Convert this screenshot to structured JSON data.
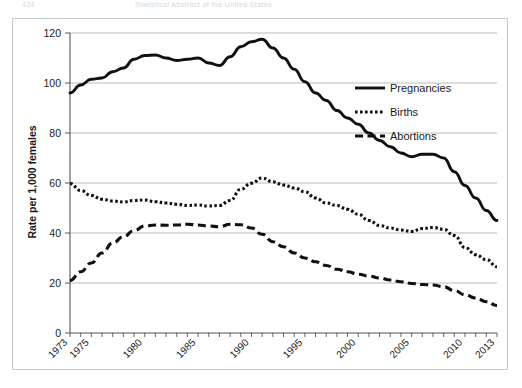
{
  "page": {
    "header_page_number": "424",
    "header_title": "Statistical Abstract of the United States"
  },
  "chart_data": {
    "type": "line",
    "title": "",
    "xlabel": "",
    "ylabel": "Rate per 1,000 females",
    "xlim": [
      1973,
      2013
    ],
    "ylim": [
      0,
      120
    ],
    "ytick_values": [
      0,
      20,
      40,
      60,
      80,
      100,
      120
    ],
    "ytick_labels": [
      "0",
      "20",
      "40",
      "60",
      "80",
      "100",
      "120"
    ],
    "xtick_labels": [
      "1973",
      "1975",
      "1980",
      "1985",
      "1990",
      "1995",
      "2000",
      "2005",
      "2010",
      "2013"
    ],
    "xtick_label_values": [
      1973,
      1975,
      1980,
      1985,
      1990,
      1995,
      2000,
      2005,
      2010,
      2013
    ],
    "minor_tick_interval": 1,
    "grid": "horizontal",
    "legend_position": "right-top",
    "x": [
      1973,
      1974,
      1975,
      1976,
      1977,
      1978,
      1979,
      1980,
      1981,
      1982,
      1983,
      1984,
      1985,
      1986,
      1987,
      1988,
      1989,
      1990,
      1991,
      1992,
      1993,
      1994,
      1995,
      1996,
      1997,
      1998,
      1999,
      2000,
      2001,
      2002,
      2003,
      2004,
      2005,
      2006,
      2007,
      2008,
      2009,
      2010,
      2011,
      2012,
      2013
    ],
    "series": [
      {
        "name": "Pregnancies",
        "style": "solid",
        "color": "#111111",
        "values": [
          96.0,
          99.2,
          101.5,
          102.0,
          104.5,
          106.0,
          109.5,
          111.0,
          111.2,
          110.0,
          109.0,
          109.5,
          110.0,
          108.0,
          107.0,
          110.5,
          114.5,
          116.5,
          117.5,
          114.0,
          110.0,
          105.5,
          100.5,
          96.0,
          93.0,
          89.0,
          86.0,
          83.5,
          80.0,
          77.0,
          74.5,
          72.0,
          70.5,
          71.5,
          71.5,
          70.0,
          64.5,
          59.0,
          54.0,
          49.0,
          45.0
        ]
      },
      {
        "name": "Births",
        "style": "dotted",
        "color": "#111111",
        "values": [
          59.8,
          57.0,
          55.0,
          53.5,
          52.8,
          52.4,
          53.0,
          53.2,
          52.5,
          52.0,
          51.5,
          51.0,
          51.2,
          50.8,
          51.0,
          53.0,
          57.5,
          59.9,
          62.0,
          60.5,
          59.2,
          58.0,
          56.5,
          54.0,
          52.0,
          51.0,
          49.5,
          47.5,
          45.0,
          43.0,
          42.0,
          41.2,
          40.6,
          41.8,
          42.2,
          41.5,
          39.0,
          34.2,
          31.3,
          29.4,
          26.5
        ]
      },
      {
        "name": "Abortions",
        "style": "dashed",
        "color": "#111111",
        "values": [
          21.0,
          24.5,
          28.0,
          32.0,
          36.0,
          38.5,
          41.0,
          42.8,
          43.2,
          43.1,
          43.2,
          43.5,
          43.2,
          42.8,
          42.5,
          43.5,
          43.3,
          42.0,
          39.5,
          36.5,
          34.5,
          32.0,
          30.0,
          28.5,
          27.0,
          25.5,
          24.5,
          23.5,
          22.8,
          22.0,
          21.2,
          20.5,
          19.8,
          19.4,
          19.2,
          18.5,
          17.0,
          15.3,
          14.0,
          12.5,
          11.0
        ]
      }
    ]
  },
  "legend": {
    "items": [
      {
        "label": "Pregnancies",
        "style": "solid"
      },
      {
        "label": "Births",
        "style": "dotted"
      },
      {
        "label": "Abortions",
        "style": "dashed"
      }
    ]
  }
}
